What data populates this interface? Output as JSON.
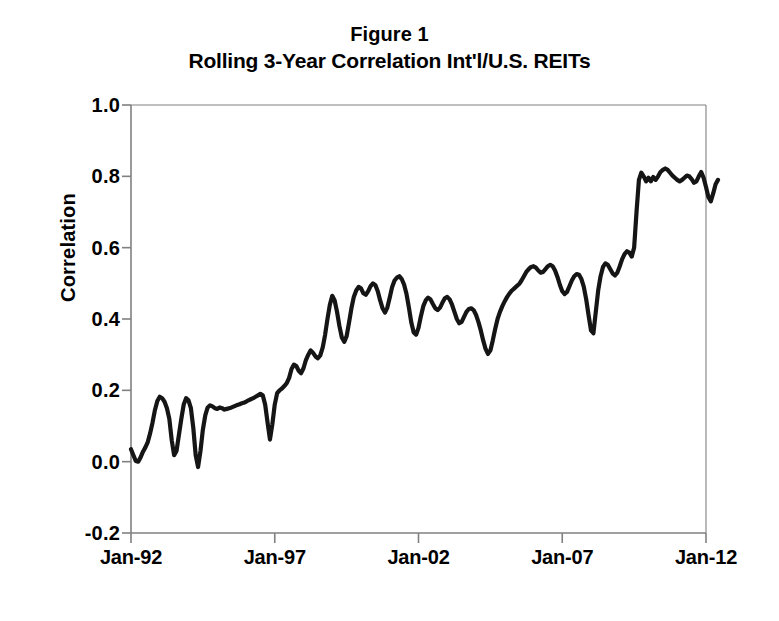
{
  "figure": {
    "title_line1": "Figure 1",
    "title_line2": "Rolling 3-Year Correlation Int'l/U.S. REITs",
    "background_color": "#ffffff",
    "line_color": "#151515",
    "axis_color": "#808080"
  },
  "chart_data": {
    "type": "line",
    "subtitle": "Rolling 3-Year Correlation Int'l/U.S. REITs",
    "xlabel": "",
    "ylabel": "Correlation",
    "ylim": [
      -0.2,
      1.0
    ],
    "xlim": [
      "Jan-92",
      "Jan-12"
    ],
    "yticks": [
      1.0,
      0.8,
      0.6,
      0.4,
      0.2,
      0.0,
      -0.2
    ],
    "ytick_labels": [
      "1.0",
      "0.8",
      "0.6",
      "0.4",
      "0.2",
      "0.0",
      "-0.2"
    ],
    "xtick_labels": [
      "Jan-92",
      "Jan-97",
      "Jan-02",
      "Jan-07",
      "Jan-12"
    ],
    "xtick_positions": [
      0,
      60,
      120,
      180,
      240
    ],
    "grid": false,
    "legend": null,
    "series": [
      {
        "name": "Rolling 3-Year Correlation Int'l/U.S. REITs",
        "color": "#151515",
        "x_start": "Jan-92",
        "x_step_months": 1,
        "n_points": 241,
        "values": [
          0.035,
          0.018,
          0.002,
          0.0,
          0.012,
          0.028,
          0.04,
          0.055,
          0.08,
          0.11,
          0.145,
          0.17,
          0.182,
          0.178,
          0.168,
          0.15,
          0.12,
          0.06,
          0.018,
          0.03,
          0.075,
          0.12,
          0.16,
          0.178,
          0.172,
          0.15,
          0.095,
          0.018,
          -0.015,
          0.03,
          0.09,
          0.13,
          0.152,
          0.158,
          0.155,
          0.15,
          0.148,
          0.152,
          0.15,
          0.146,
          0.148,
          0.15,
          0.152,
          0.155,
          0.158,
          0.16,
          0.163,
          0.165,
          0.168,
          0.172,
          0.175,
          0.178,
          0.182,
          0.186,
          0.19,
          0.186,
          0.16,
          0.11,
          0.062,
          0.105,
          0.16,
          0.192,
          0.2,
          0.205,
          0.212,
          0.22,
          0.235,
          0.26,
          0.272,
          0.268,
          0.255,
          0.248,
          0.262,
          0.285,
          0.3,
          0.312,
          0.305,
          0.295,
          0.29,
          0.298,
          0.32,
          0.355,
          0.4,
          0.44,
          0.465,
          0.452,
          0.42,
          0.38,
          0.348,
          0.336,
          0.352,
          0.39,
          0.43,
          0.462,
          0.48,
          0.49,
          0.486,
          0.472,
          0.468,
          0.478,
          0.492,
          0.5,
          0.495,
          0.478,
          0.452,
          0.43,
          0.418,
          0.432,
          0.46,
          0.49,
          0.508,
          0.516,
          0.52,
          0.512,
          0.496,
          0.47,
          0.432,
          0.39,
          0.362,
          0.356,
          0.375,
          0.408,
          0.436,
          0.452,
          0.46,
          0.455,
          0.442,
          0.43,
          0.425,
          0.432,
          0.446,
          0.458,
          0.462,
          0.455,
          0.44,
          0.42,
          0.4,
          0.388,
          0.392,
          0.406,
          0.42,
          0.428,
          0.43,
          0.425,
          0.412,
          0.392,
          0.368,
          0.34,
          0.316,
          0.302,
          0.312,
          0.34,
          0.372,
          0.4,
          0.42,
          0.436,
          0.45,
          0.462,
          0.472,
          0.48,
          0.486,
          0.492,
          0.498,
          0.508,
          0.52,
          0.532,
          0.54,
          0.546,
          0.548,
          0.544,
          0.536,
          0.53,
          0.532,
          0.54,
          0.548,
          0.552,
          0.548,
          0.536,
          0.518,
          0.496,
          0.478,
          0.47,
          0.476,
          0.492,
          0.508,
          0.52,
          0.526,
          0.524,
          0.512,
          0.49,
          0.455,
          0.41,
          0.368,
          0.36,
          0.42,
          0.48,
          0.52,
          0.546,
          0.556,
          0.552,
          0.54,
          0.528,
          0.522,
          0.53,
          0.548,
          0.568,
          0.582,
          0.59,
          0.586,
          0.575,
          0.6,
          0.7,
          0.79,
          0.81,
          0.8,
          0.786,
          0.796,
          0.786,
          0.798,
          0.79,
          0.8,
          0.812,
          0.818,
          0.822,
          0.818,
          0.81,
          0.802,
          0.796,
          0.79,
          0.786,
          0.79,
          0.796,
          0.802,
          0.8,
          0.792,
          0.782,
          0.786,
          0.8,
          0.812,
          0.796,
          0.77,
          0.742,
          0.73,
          0.752,
          0.778,
          0.79
        ]
      }
    ]
  }
}
